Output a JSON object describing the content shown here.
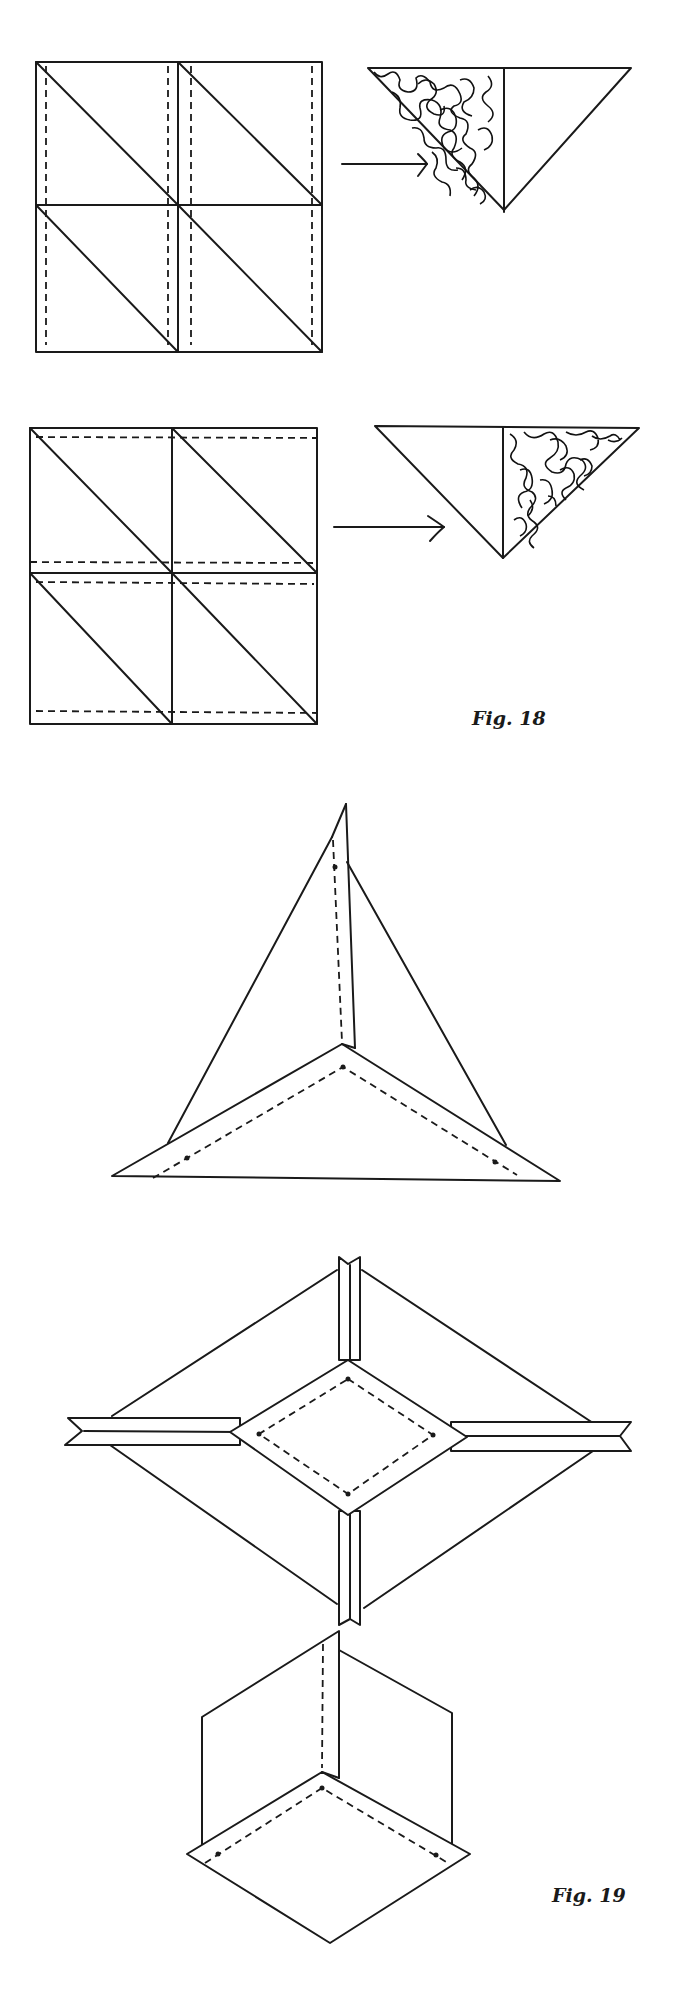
{
  "figures": [
    {
      "id": "fig-18",
      "caption": "Fig. 18",
      "caption_pos": {
        "x": 472,
        "y": 707
      },
      "panels": [
        {
          "name": "grid-vertical-dashed",
          "square": {
            "x": 36,
            "y": 62,
            "w": 286,
            "h": 290
          },
          "mid": {
            "x": 178,
            "y": 205
          },
          "dashed_x": [
            46,
            168,
            191,
            312
          ],
          "diagonals": [
            [
              36,
              62,
              178,
              205
            ],
            [
              178,
              62,
              322,
              205
            ],
            [
              36,
              205,
              178,
              352
            ],
            [
              178,
              205,
              322,
              352
            ]
          ],
          "result_triangle": {
            "points": "368,68 631,68 504,210",
            "fold_x": 504,
            "shaded_side": "left"
          },
          "arrow": {
            "x1": 342,
            "x2": 427,
            "y": 164
          }
        },
        {
          "name": "grid-horizontal-dashed",
          "square": {
            "x": 30,
            "y": 428,
            "w": 287,
            "h": 296
          },
          "mid": {
            "x": 172,
            "y": 573
          },
          "dashed_y": [
            437,
            562,
            582,
            711
          ],
          "diagonals": [
            [
              30,
              428,
              172,
              573
            ],
            [
              172,
              428,
              317,
              573
            ],
            [
              30,
              573,
              172,
              724
            ],
            [
              172,
              573,
              317,
              724
            ]
          ],
          "result_triangle": {
            "points": "375,426 639,428 503,558",
            "fold_x": 503,
            "shaded_side": "right"
          },
          "arrow": {
            "x1": 334,
            "x2": 444,
            "y": 527
          }
        }
      ]
    },
    {
      "id": "fig-19",
      "caption": "Fig. 19",
      "caption_pos": {
        "x": 552,
        "y": 1884
      }
    }
  ],
  "icons": {
    "arrow": "right-arrow-icon"
  }
}
